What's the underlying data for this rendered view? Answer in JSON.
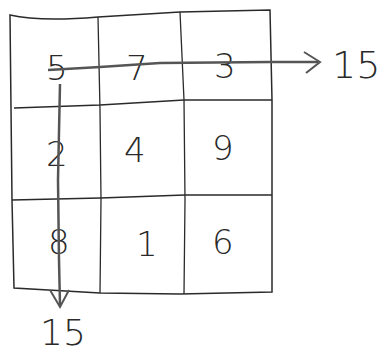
{
  "diagram": {
    "type": "magic-square-sketch",
    "grid": [
      [
        "5",
        "7",
        "3"
      ],
      [
        "2",
        "4",
        "9"
      ],
      [
        "8",
        "1",
        "6"
      ]
    ],
    "row_sum_label": "15",
    "column_sum_label": "15",
    "colors": {
      "ink": "#2a2a2a",
      "arrow": "#555555",
      "background": "#ffffff"
    }
  }
}
